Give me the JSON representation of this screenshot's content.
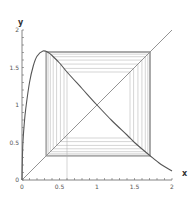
{
  "chart_data": {
    "type": "line",
    "title": "",
    "xlabel": "x",
    "ylabel": "y",
    "xlim": [
      0,
      2
    ],
    "ylim": [
      0,
      2
    ],
    "grid": false,
    "x_ticks": [
      {
        "value": 0,
        "label": "0"
      },
      {
        "value": 0.5,
        "label": "0.5"
      },
      {
        "value": 1,
        "label": "1"
      },
      {
        "value": 1.5,
        "label": "1.5"
      },
      {
        "value": 2,
        "label": "2"
      }
    ],
    "y_ticks": [
      {
        "value": 0,
        "label": "0"
      },
      {
        "value": 0.5,
        "label": "0.5"
      },
      {
        "value": 1,
        "label": "1"
      },
      {
        "value": 1.5,
        "label": "1.5"
      },
      {
        "value": 2,
        "label": "2"
      }
    ],
    "minor_tick_step": 0.1,
    "series": [
      {
        "name": "f(x)",
        "color": "#555555",
        "x": [
          0,
          0.01,
          0.03,
          0.05,
          0.1,
          0.15,
          0.2,
          0.28,
          0.35,
          0.4,
          0.5,
          0.6,
          0.8,
          1.0,
          1.2,
          1.4,
          1.5,
          1.7,
          1.85,
          2.0
        ],
        "y": [
          0,
          0.45,
          0.75,
          0.95,
          1.3,
          1.52,
          1.65,
          1.72,
          1.7,
          1.66,
          1.56,
          1.44,
          1.22,
          1.0,
          0.79,
          0.6,
          0.5,
          0.33,
          0.21,
          0.12
        ]
      },
      {
        "name": "y = x",
        "color": "#888888",
        "x": [
          0,
          2
        ],
        "y": [
          0,
          2
        ]
      }
    ],
    "cobweb": {
      "start_x": 0.6,
      "iterations": 40,
      "color": "#aaaaaa",
      "fixed_point": [
        1,
        1
      ]
    }
  }
}
